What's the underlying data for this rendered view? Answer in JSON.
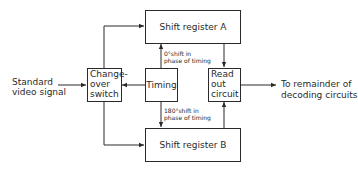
{
  "diagram": {
    "blocks": {
      "shift_register_a": {
        "label": "Shift register A"
      },
      "shift_register_b": {
        "label": "Shift register B"
      },
      "changeover_switch": {
        "line1": "Change-",
        "line2": "over",
        "line3": "switch"
      },
      "timing": {
        "label": "Timing"
      },
      "readout": {
        "line1": "Read",
        "line2": "out",
        "line3": "circuit"
      }
    },
    "input": {
      "line1": "Standard",
      "line2": "video signal"
    },
    "output": {
      "line1": "To remainder of",
      "line2": "decoding circuits"
    },
    "annotations": {
      "top_phase": {
        "line1": "0°shift in",
        "line2": "phase of timing"
      },
      "bottom_phase": {
        "line1": "180°shift in",
        "line2": "phase of timing"
      }
    },
    "colors": {
      "line": "#2a2a2a",
      "background": "#ffffff"
    }
  }
}
